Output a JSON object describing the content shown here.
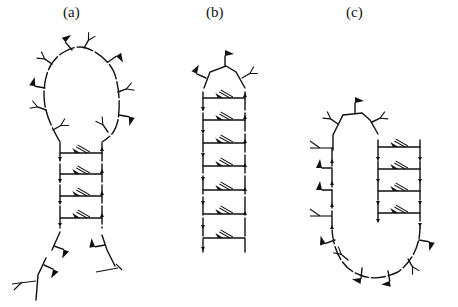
{
  "figure": {
    "panels": [
      {
        "id": "a",
        "label": "(a)",
        "shape": "hairpin with large loop and splayed tails",
        "base_pairs": 4
      },
      {
        "id": "b",
        "label": "(b)",
        "shape": "stem with small tetraloop-like cap",
        "base_pairs": 6
      },
      {
        "id": "c",
        "label": "(c)",
        "shape": "U-shaped hairpin with offset stem",
        "base_pairs": 4
      }
    ],
    "colors": {
      "ink": "#111111",
      "background": "#ffffff"
    }
  }
}
